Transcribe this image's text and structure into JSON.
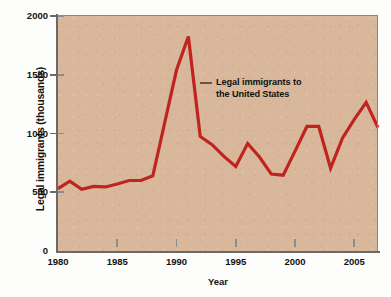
{
  "chart_data": {
    "type": "line",
    "title": "",
    "subtitle": "",
    "xlabel": "Year",
    "ylabel": "Legal immigrants (thousands)",
    "xlim": [
      1980,
      2007
    ],
    "ylim": [
      0,
      2000
    ],
    "grid": false,
    "legend_position": "inside-plot-annotation",
    "background_color": "#d8b79b",
    "line_color": "#c0241f",
    "annotation_dash_color": "#7a4f42",
    "text_color": "#121212",
    "axis_color": "#6b6a68",
    "xticks": [
      1980,
      1985,
      1990,
      1995,
      2000,
      2005
    ],
    "xtick_labels": [
      "1980",
      "1985",
      "1990",
      "1995",
      "2000",
      "2005"
    ],
    "yticks": [
      0,
      500,
      1000,
      1500,
      2000
    ],
    "ytick_labels": [
      "0",
      "500",
      "1000",
      "1500",
      "2000"
    ],
    "annotations": [
      {
        "name": "series-label",
        "text": "Legal immigrants to\nthe United States",
        "x": 1992.5,
        "y": 1475
      }
    ],
    "series": [
      {
        "name": "Legal immigrants to the United States",
        "color": "#c0241f",
        "x": [
          1980,
          1981,
          1982,
          1983,
          1984,
          1985,
          1986,
          1987,
          1988,
          1989,
          1990,
          1991,
          1992,
          1993,
          1994,
          1995,
          1996,
          1997,
          1998,
          1999,
          2000,
          2001,
          2002,
          2003,
          2004,
          2005,
          2006,
          2007
        ],
        "values": [
          530,
          595,
          525,
          550,
          545,
          570,
          600,
          600,
          640,
          1090,
          1540,
          1825,
          975,
          905,
          805,
          720,
          915,
          800,
          655,
          645,
          850,
          1060,
          1060,
          705,
          960,
          1120,
          1265,
          1050
        ]
      }
    ]
  },
  "axes": {
    "ylabel": "Legal immigrants (thousands)",
    "xlabel": "Year"
  }
}
